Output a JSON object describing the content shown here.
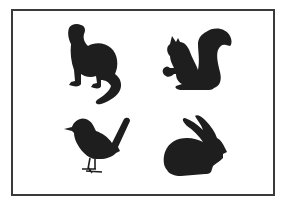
{
  "figure": {
    "title": "Animal silhouettes",
    "border_color": "#3a3a3a",
    "silhouette_color": "#1e1e1e",
    "items": [
      {
        "label": "ferret"
      },
      {
        "label": "squirrel"
      },
      {
        "label": "bird"
      },
      {
        "label": "rabbit"
      }
    ]
  }
}
